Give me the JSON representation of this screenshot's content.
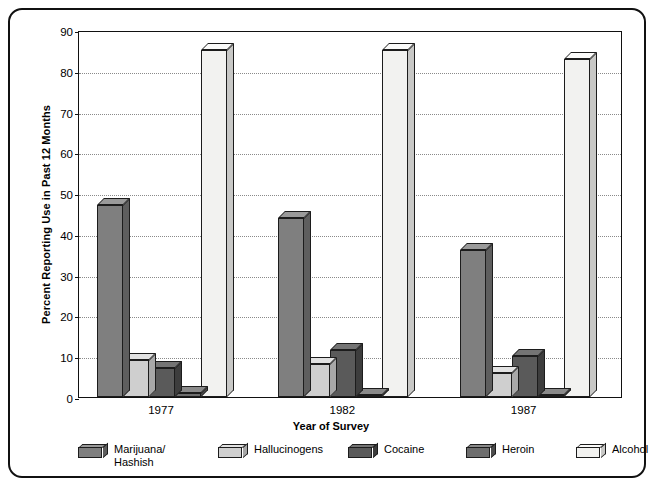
{
  "chart_data": {
    "type": "bar",
    "title": "",
    "subtitle": "",
    "xlabel": "Year of Survey",
    "ylabel": "Percent Reporting Use in Past 12 Months",
    "categories": [
      "1977",
      "1982",
      "1987"
    ],
    "ylim": [
      0,
      90
    ],
    "yticks": [
      0,
      10,
      20,
      30,
      40,
      50,
      60,
      70,
      80,
      90
    ],
    "ytick_labels": [
      "0",
      "10",
      "20",
      "30",
      "40",
      "50",
      "60",
      "70",
      "80",
      "90"
    ],
    "grid": true,
    "grid_style": "dotted-horizontal",
    "legend_position": "bottom",
    "bar_style": "3d-extruded",
    "series": [
      {
        "name": "Marijuana/\nHashish",
        "legend_label": "Marijuana/\nHashish",
        "color": "#7f7f7f",
        "top_color": "#9a9a9a",
        "side_color": "#5e5e5e",
        "values": [
          47,
          44,
          36
        ]
      },
      {
        "name": "Hallucinogens",
        "legend_label": "Hallucinogens",
        "color": "#cfcfcf",
        "top_color": "#e2e2e2",
        "side_color": "#a8a8a8",
        "values": [
          9,
          8,
          6
        ]
      },
      {
        "name": "Cocaine",
        "legend_label": "Cocaine",
        "color": "#5a5a5a",
        "top_color": "#747474",
        "side_color": "#3d3d3d",
        "values": [
          7,
          11.5,
          10
        ]
      },
      {
        "name": "Heroin",
        "legend_label": "Heroin",
        "color": "#6e6e6e",
        "top_color": "#8a8a8a",
        "side_color": "#4d4d4d",
        "values": [
          1,
          0.6,
          0.5
        ]
      },
      {
        "name": "Alcohol",
        "legend_label": "Alcohol",
        "color": "#f2f2f0",
        "top_color": "#fbfbfa",
        "side_color": "#c8c8c6",
        "values": [
          85,
          85,
          83
        ]
      }
    ]
  },
  "axis": {
    "y_title": "Percent Reporting Use in Past 12 Months",
    "x_title": "Year of Survey"
  },
  "legend": {
    "items": [
      {
        "label": "Marijuana/\nHashish"
      },
      {
        "label": "Hallucinogens"
      },
      {
        "label": "Cocaine"
      },
      {
        "label": "Heroin"
      },
      {
        "label": "Alcohol"
      }
    ]
  }
}
